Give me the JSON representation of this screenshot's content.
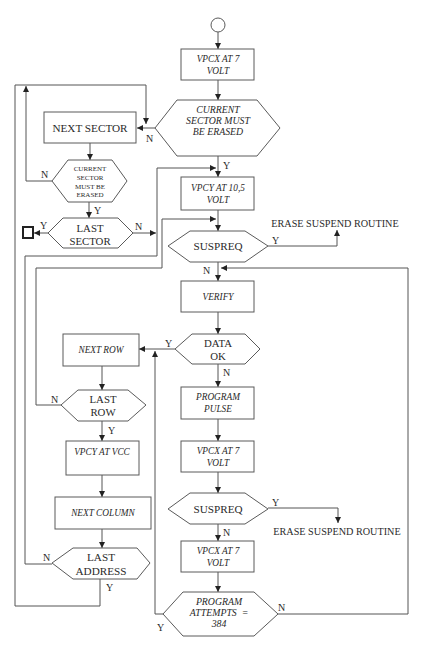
{
  "flowchart": {
    "nodes": {
      "vpcx_7_top": {
        "lines": [
          "VPCX AT 7",
          "VOLT"
        ]
      },
      "sector_check_main": {
        "lines": [
          "CURRENT",
          "SECTOR MUST",
          "BE ERASED"
        ]
      },
      "next_sector": {
        "lines": [
          "NEXT SECTOR"
        ]
      },
      "sector_check_small": {
        "lines": [
          "CURRENT",
          "SECTOR",
          "MUST BE",
          "ERASED"
        ]
      },
      "last_sector": {
        "lines": [
          "LAST",
          "SECTOR"
        ]
      },
      "vpcy_10_5": {
        "lines": [
          "VPCY AT 10,5",
          "VOLT"
        ]
      },
      "suspreq_1": {
        "lines": [
          "SUSPREQ"
        ]
      },
      "erase_suspend_1": {
        "text": "ERASE SUSPEND ROUTINE"
      },
      "verify": {
        "lines": [
          "VERIFY"
        ]
      },
      "data_ok": {
        "lines": [
          "DATA",
          "OK"
        ]
      },
      "next_row": {
        "lines": [
          "NEXT ROW"
        ]
      },
      "program_pulse": {
        "lines": [
          "PROGRAM",
          "PULSE"
        ]
      },
      "last_row": {
        "lines": [
          "LAST",
          "ROW"
        ]
      },
      "vpcy_vcc": {
        "lines": [
          "VPCY AT VCC"
        ]
      },
      "vpcx_7_mid": {
        "lines": [
          "VPCX AT 7",
          "VOLT"
        ]
      },
      "next_column": {
        "lines": [
          "NEXT COLUMN"
        ]
      },
      "suspreq_2": {
        "lines": [
          "SUSPREQ"
        ]
      },
      "erase_suspend_2": {
        "text": "ERASE SUSPEND ROUTINE"
      },
      "vpcx_7_bottom": {
        "lines": [
          "VPCX AT 7",
          "VOLT"
        ]
      },
      "last_address": {
        "lines": [
          "LAST",
          "ADDRESS"
        ]
      },
      "program_attempts": {
        "lines": [
          "PROGRAM",
          "ATTEMPTS  =",
          "384"
        ]
      }
    },
    "edge_labels": {
      "sector_check_main_no": "N",
      "sector_check_main_yes": "Y",
      "sector_check_small_no": "N",
      "sector_check_small_yes": "Y",
      "last_sector_yes": "Y",
      "last_sector_no": "N",
      "suspreq_1_yes": "Y",
      "suspreq_1_no": "N",
      "data_ok_yes": "Y",
      "data_ok_no": "N",
      "last_row_no": "N",
      "last_row_yes": "Y",
      "suspreq_2_yes": "Y",
      "suspreq_2_no": "N",
      "last_address_no": "N",
      "last_address_yes": "Y",
      "program_attempts_no": "N",
      "program_attempts_yes": "Y"
    }
  }
}
